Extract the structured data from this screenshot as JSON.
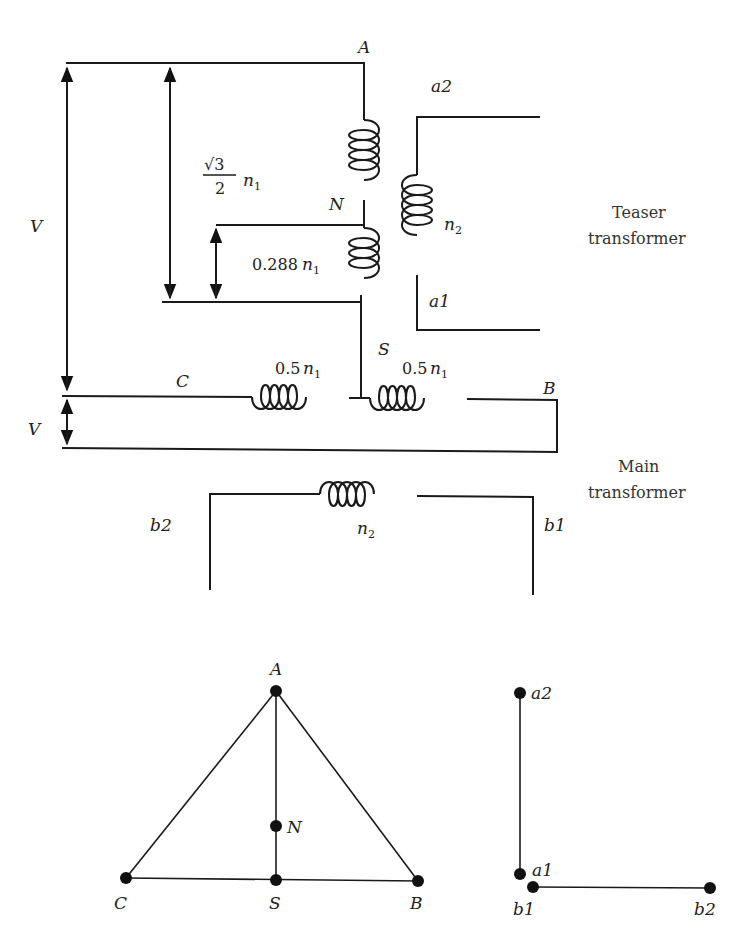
{
  "figure": {
    "nodes": {
      "A": "A",
      "N": "N",
      "S": "S",
      "B": "B",
      "C": "C",
      "a1": "a1",
      "a2": "a2",
      "b1": "b1",
      "b2": "b2"
    },
    "voltage_label": "V",
    "teaser": {
      "label_line1": "Teaser",
      "label_line2": "transformer",
      "primary_upper_ratio_num": "√3",
      "primary_upper_ratio_den": "2",
      "primary_upper_var": "n",
      "primary_upper_sub": "1",
      "primary_lower_coef": "0.288",
      "primary_lower_var": "n",
      "primary_lower_sub": "1",
      "secondary_var": "n",
      "secondary_sub": "2"
    },
    "main": {
      "label_line1": "Main",
      "label_line2": "transformer",
      "left_half_coef": "0.5",
      "right_half_coef": "0.5",
      "half_var": "n",
      "half_sub": "1",
      "secondary_var": "n",
      "secondary_sub": "2"
    },
    "phasor_primary": [
      "A",
      "B",
      "C",
      "S",
      "N"
    ],
    "phasor_secondary": [
      "a1",
      "a2",
      "b1",
      "b2"
    ]
  }
}
